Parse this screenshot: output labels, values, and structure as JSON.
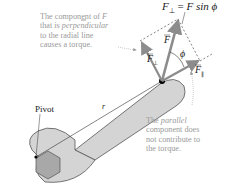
{
  "diagram": {
    "title_equation": "F⊥ = F sin ϕ",
    "equation": {
      "lhs": "F",
      "lhs_sub": "⊥",
      "eq": "=",
      "rhs": "F sin ϕ"
    },
    "labels": {
      "force": "F",
      "force_perp": "F",
      "force_perp_sub": "⊥",
      "force_parallel": "F",
      "force_parallel_sub": "∥",
      "angle": "ϕ",
      "radius": "r",
      "pivot": "Pivot"
    },
    "notes": {
      "perpendicular": {
        "line1_a": "The component of ",
        "line1_b": "F",
        "line2_a": "that is ",
        "line2_b": "perpendicular",
        "line3": "to the radial line",
        "line4": "causes a torque."
      },
      "parallel": {
        "line1_a": "The ",
        "line1_b": "parallel",
        "line2": "component does",
        "line3": "not contribute to",
        "line4": "the torque."
      }
    },
    "colors": {
      "wrench_fill": "#d4d4d4",
      "wrench_stroke": "#555555",
      "nut_fill": "#a8a8a8",
      "arrow": "#8c8c8c",
      "note_text": "#9a9a9a",
      "label_text": "#222222"
    }
  }
}
